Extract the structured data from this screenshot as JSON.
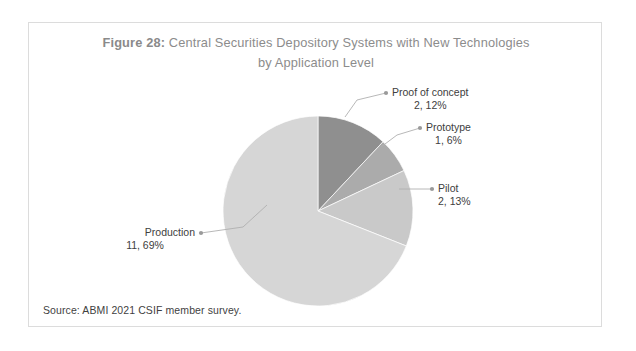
{
  "figure": {
    "label": "Figure 28:",
    "title_line1": " Central Securities Depository Systems with New Technologies",
    "title_line2": "by Application Level",
    "source": "Source: ABMI 2021 CSIF member survey."
  },
  "chart_data": {
    "type": "pie",
    "title": "Figure 28: Central Securities Depository Systems with New Technologies by Application Level",
    "xlabel": "",
    "ylabel": "",
    "legend_position": "none",
    "grid": false,
    "total_count": 16,
    "categories": [
      "Proof of concept",
      "Prototype",
      "Pilot",
      "Production"
    ],
    "values": [
      2,
      1,
      2,
      11
    ],
    "percentages": [
      12,
      6,
      13,
      69
    ],
    "colors": [
      "#8f8f8f",
      "#ababab",
      "#c9c9c9",
      "#d6d6d6"
    ],
    "slices": [
      {
        "name": "Proof of concept",
        "count": 2,
        "percent": 12,
        "value_label": "2, 12%",
        "color": "#8f8f8f",
        "start_angle": 0,
        "end_angle": 43.2
      },
      {
        "name": "Prototype",
        "count": 1,
        "percent": 6,
        "value_label": "1, 6%",
        "color": "#ababab",
        "start_angle": 43.2,
        "end_angle": 64.8
      },
      {
        "name": "Pilot",
        "count": 2,
        "percent": 13,
        "value_label": "2, 13%",
        "color": "#c9c9c9",
        "start_angle": 64.8,
        "end_angle": 111.6
      },
      {
        "name": "Production",
        "count": 11,
        "percent": 69,
        "value_label": "11, 69%",
        "color": "#d6d6d6",
        "start_angle": 111.6,
        "end_angle": 360
      }
    ]
  }
}
